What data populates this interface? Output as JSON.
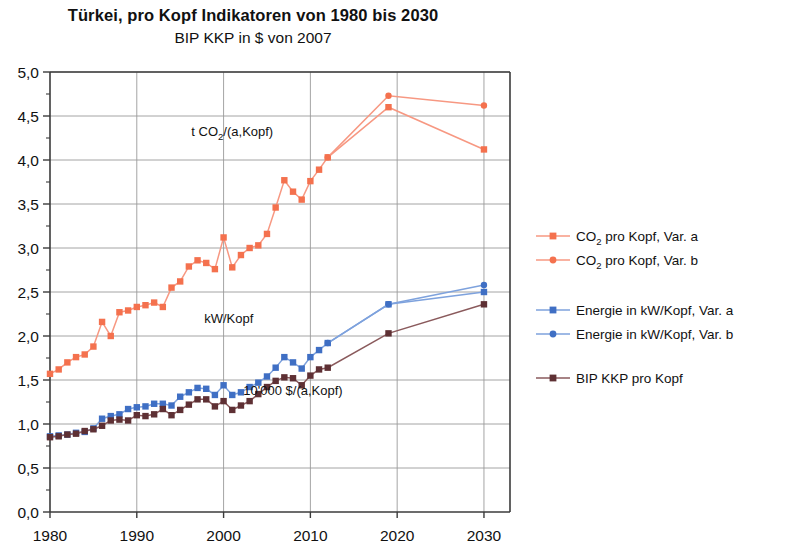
{
  "header": {
    "title": "Türkei, pro Kopf Indikatoren von 1980 bis 2030",
    "subtitle": "BIP KKP in $ von 2007"
  },
  "annotations": [
    {
      "id": "co2-annotation",
      "text_prefix": "t CO",
      "text_sub": "2",
      "text_suffix": "/(a,Kopf)",
      "x": 2001,
      "y": 4.27
    },
    {
      "id": "energy-annotation",
      "text": "kW/Kopf",
      "x": 2000.6,
      "y": 2.15
    },
    {
      "id": "gdp-annotation",
      "text": "10'000 $/(a,Kopf)",
      "x": 2008.0,
      "y": 1.33
    }
  ],
  "legend": {
    "position": "right",
    "items": [
      {
        "label_prefix": "CO",
        "label_sub": "2",
        "label_suffix": " pro Kopf, Var. a",
        "color": "#f4714e",
        "line_color": "#f79882",
        "marker": "square"
      },
      {
        "label_prefix": "CO",
        "label_sub": "2",
        "label_suffix": " pro Kopf, Var. b",
        "color": "#f4714e",
        "line_color": "#f79882",
        "marker": "circle"
      },
      {
        "label": "Energie in kW/Kopf, Var. a",
        "color": "#3f6fc4",
        "line_color": "#7ea2dd",
        "marker": "square"
      },
      {
        "label": "Energie in kW/Kopf, Var. b",
        "color": "#3f6fc4",
        "line_color": "#7ea2dd",
        "marker": "circle"
      },
      {
        "label": "BIP KKP pro Kopf",
        "color": "#5e3034",
        "line_color": "#8a5a5c",
        "marker": "square"
      }
    ]
  },
  "chart_data": {
    "type": "line",
    "title": "Türkei, pro Kopf Indikatoren von 1980 bis 2030",
    "subtitle": "BIP KKP in $ von 2007",
    "xlabel": "",
    "ylabel": "",
    "xlim": [
      1980,
      2033
    ],
    "ylim": [
      0.0,
      5.0
    ],
    "xticks": [
      1980,
      1990,
      2000,
      2010,
      2020,
      2030
    ],
    "xtick_labels": [
      "1980",
      "1990",
      "2000",
      "2010",
      "2020",
      "2030"
    ],
    "yticks": [
      0.0,
      0.5,
      1.0,
      1.5,
      2.0,
      2.5,
      3.0,
      3.5,
      4.0,
      4.5,
      5.0
    ],
    "ytick_labels": [
      "0,0",
      "0,5",
      "1,0",
      "1,5",
      "2,0",
      "2,5",
      "3,0",
      "3,5",
      "4,0",
      "4,5",
      "5,0"
    ],
    "yminor_step": 0.25,
    "grid": true,
    "grid_axis": "both",
    "series": [
      {
        "name": "CO2 pro Kopf, Var. a",
        "color": "#f4714e",
        "line_color": "#f79882",
        "marker": "square",
        "x": [
          1980,
          1981,
          1982,
          1983,
          1984,
          1985,
          1986,
          1987,
          1988,
          1989,
          1990,
          1991,
          1992,
          1993,
          1994,
          1995,
          1996,
          1997,
          1998,
          1999,
          2000,
          2001,
          2002,
          2003,
          2004,
          2005,
          2006,
          2007,
          2008,
          2009,
          2010,
          2011,
          2012,
          2019,
          2030
        ],
        "y": [
          1.57,
          1.62,
          1.7,
          1.76,
          1.79,
          1.88,
          2.16,
          2.0,
          2.27,
          2.29,
          2.33,
          2.35,
          2.38,
          2.33,
          2.55,
          2.62,
          2.79,
          2.86,
          2.83,
          2.76,
          3.12,
          2.78,
          2.92,
          3.0,
          3.03,
          3.16,
          3.46,
          3.77,
          3.64,
          3.55,
          3.76,
          3.89,
          4.03,
          4.6,
          4.12
        ]
      },
      {
        "name": "CO2 pro Kopf, Var. b",
        "color": "#f4714e",
        "line_color": "#f79882",
        "marker": "circle",
        "x": [
          2012,
          2019,
          2030
        ],
        "y": [
          4.03,
          4.73,
          4.62
        ]
      },
      {
        "name": "Energie in kW/Kopf, Var. a",
        "color": "#3f6fc4",
        "line_color": "#7ea2dd",
        "marker": "square",
        "x": [
          1980,
          1981,
          1982,
          1983,
          1984,
          1985,
          1986,
          1987,
          1988,
          1989,
          1990,
          1991,
          1992,
          1993,
          1994,
          1995,
          1996,
          1997,
          1998,
          1999,
          2000,
          2001,
          2002,
          2003,
          2004,
          2005,
          2006,
          2007,
          2008,
          2009,
          2010,
          2011,
          2012,
          2019,
          2030
        ],
        "y": [
          0.86,
          0.87,
          0.88,
          0.9,
          0.91,
          0.95,
          1.06,
          1.09,
          1.11,
          1.17,
          1.19,
          1.2,
          1.23,
          1.23,
          1.21,
          1.31,
          1.36,
          1.41,
          1.4,
          1.33,
          1.44,
          1.33,
          1.36,
          1.42,
          1.47,
          1.54,
          1.64,
          1.76,
          1.7,
          1.63,
          1.76,
          1.84,
          1.92,
          2.36,
          2.5
        ]
      },
      {
        "name": "Energie in kW/Kopf, Var. b",
        "color": "#3f6fc4",
        "line_color": "#7ea2dd",
        "marker": "circle",
        "x": [
          2012,
          2019,
          2030
        ],
        "y": [
          1.92,
          2.36,
          2.58
        ]
      },
      {
        "name": "BIP KKP pro Kopf",
        "color": "#5e3034",
        "line_color": "#8a5a5c",
        "marker": "square",
        "x": [
          1980,
          1981,
          1982,
          1983,
          1984,
          1985,
          1986,
          1987,
          1988,
          1989,
          1990,
          1991,
          1992,
          1993,
          1994,
          1995,
          1996,
          1997,
          1998,
          1999,
          2000,
          2001,
          2002,
          2003,
          2004,
          2005,
          2006,
          2007,
          2008,
          2009,
          2010,
          2011,
          2012,
          2019,
          2030
        ],
        "y": [
          0.85,
          0.86,
          0.88,
          0.89,
          0.92,
          0.94,
          0.98,
          1.04,
          1.05,
          1.04,
          1.1,
          1.09,
          1.11,
          1.17,
          1.1,
          1.16,
          1.22,
          1.28,
          1.28,
          1.2,
          1.26,
          1.16,
          1.21,
          1.26,
          1.34,
          1.42,
          1.49,
          1.53,
          1.52,
          1.44,
          1.55,
          1.62,
          1.64,
          2.03,
          2.36
        ]
      }
    ]
  }
}
